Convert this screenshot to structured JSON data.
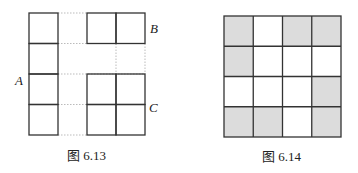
{
  "figure_left": {
    "caption": "图 6.13",
    "labels": {
      "A": "A",
      "B": "B",
      "C": "C"
    },
    "rows": 4,
    "cols": 4,
    "solid_cells": [
      [
        0,
        0
      ],
      [
        1,
        0
      ],
      [
        2,
        0
      ],
      [
        3,
        0
      ],
      [
        0,
        2
      ],
      [
        0,
        3
      ],
      [
        2,
        2
      ],
      [
        2,
        3
      ],
      [
        3,
        2
      ],
      [
        3,
        3
      ]
    ]
  },
  "figure_right": {
    "caption": "图 6.14",
    "rows": 4,
    "cols": 4,
    "shaded_cells": [
      [
        0,
        0
      ],
      [
        0,
        2
      ],
      [
        0,
        3
      ],
      [
        1,
        0
      ],
      [
        2,
        3
      ],
      [
        3,
        0
      ],
      [
        3,
        1
      ],
      [
        3,
        3
      ]
    ],
    "shade_color": "#dcdcdc"
  }
}
